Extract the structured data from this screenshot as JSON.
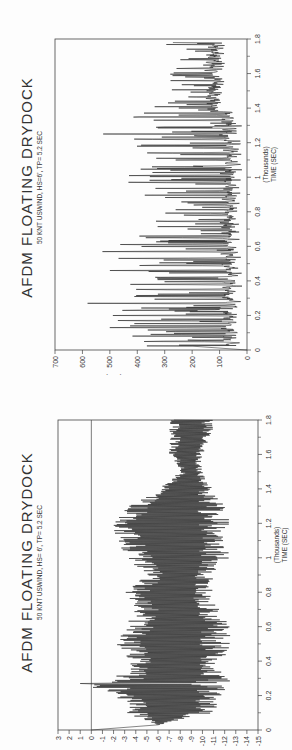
{
  "page": {
    "orientation": "rotated 90deg counter-clockwise (landscape page scanned in portrait)"
  },
  "chart_data": [
    {
      "type": "line",
      "title": "AFDM FLOATING DRYDOCK",
      "subtitle": "50 KNT USWIND, HS=6', TP= 5.2 SEC",
      "xlabel": "TIME (SEC)",
      "xlabel_units": "(Thousands)",
      "ylabel": "MOORING LINE FORCE (LBS)",
      "ylabel_units": "(Thousands)",
      "xlim": [
        0,
        1.8
      ],
      "ylim": [
        0,
        700
      ],
      "x_ticks": [
        "0",
        "0.2",
        "0.4",
        "0.6",
        "0.8",
        "1",
        "1.2",
        "1.4",
        "1.6",
        "1.8"
      ],
      "y_ticks": [
        "0",
        "100",
        "200",
        "300",
        "400",
        "500",
        "600",
        "700"
      ],
      "grid": false,
      "legend": null,
      "description": "Highly oscillatory mooring line force time series; baseline ~40-80 kips with frequent spikes. Largest spikes ~630 kips near t=0.27, ~600 near t=0.57, ~530 near t=1.25.",
      "series": [
        {
          "name": "Mooring line force",
          "peaks_x": [
            0.05,
            0.09,
            0.13,
            0.17,
            0.2,
            0.23,
            0.27,
            0.31,
            0.35,
            0.38,
            0.42,
            0.46,
            0.49,
            0.53,
            0.57,
            0.61,
            0.65,
            0.7,
            0.78,
            0.84,
            0.92,
            0.97,
            1.01,
            1.06,
            1.1,
            1.14,
            1.18,
            1.22,
            1.25,
            1.29,
            1.33,
            1.36,
            1.42,
            1.47,
            1.53,
            1.58,
            1.63,
            1.68,
            1.73,
            1.78
          ],
          "peaks_y": [
            450,
            390,
            570,
            550,
            500,
            560,
            630,
            480,
            460,
            445,
            430,
            500,
            470,
            520,
            600,
            540,
            400,
            250,
            280,
            230,
            250,
            480,
            490,
            380,
            300,
            420,
            440,
            500,
            530,
            420,
            360,
            280,
            230,
            160,
            210,
            260,
            300,
            260,
            240,
            270
          ],
          "baseline_approx": 50
        }
      ]
    },
    {
      "type": "line",
      "title": "AFDM FLOATING DRYDOCK",
      "subtitle": "50 KNT USWIND, HS= 6', TP= 5.2 SEC",
      "xlabel": "TIME (SEC)",
      "xlabel_units": "(Thousands)",
      "ylabel": "SWAY (FT)",
      "xlim": [
        0,
        1.8
      ],
      "ylim": [
        -15,
        3
      ],
      "x_ticks": [
        "0",
        "0.2",
        "0.4",
        "0.6",
        "0.8",
        "1",
        "1.2",
        "1.4",
        "1.6",
        "1.8"
      ],
      "y_ticks": [
        "3",
        "2",
        "1",
        "0",
        "-1",
        "-2",
        "-3",
        "-4",
        "-5",
        "-6",
        "-7",
        "-8",
        "-9",
        "-10",
        "-11",
        "-12",
        "-13",
        "-14",
        "-15"
      ],
      "grid": false,
      "reference_line_y": 0,
      "legend": null,
      "description": "Sway oscillates roughly between -2 and -13 ft; initial drift from 0 to about -6 in first ~0.03k sec; spike up to ~+1 ft near t=0.27; envelope narrows after t=1.4 to about -8..-11.",
      "series": [
        {
          "name": "Sway",
          "envelope_x": [
            0.0,
            0.03,
            0.1,
            0.2,
            0.27,
            0.3,
            0.4,
            0.5,
            0.6,
            0.7,
            0.8,
            0.9,
            1.0,
            1.1,
            1.2,
            1.3,
            1.4,
            1.5,
            1.6,
            1.7,
            1.8
          ],
          "envelope_max": [
            0,
            -6,
            -3,
            -2,
            1,
            -2,
            -3,
            -2,
            -3,
            -4,
            -3,
            -5,
            -3,
            -2,
            -2,
            -3,
            -6,
            -8,
            -7,
            -7,
            -7
          ],
          "envelope_min": [
            0,
            -6,
            -11,
            -12,
            -12.5,
            -12.5,
            -12,
            -12.5,
            -12.5,
            -11.5,
            -11,
            -11,
            -12.5,
            -12,
            -12.5,
            -12,
            -11,
            -10,
            -10,
            -11,
            -11
          ]
        }
      ]
    }
  ],
  "charts": {
    "top": {
      "title": "AFDM FLOATING DRYDOCK",
      "subtitle": "50 KNT USWIND, HS=6', TP= 5.2 SEC",
      "ylabel": "MOORING LINE FORCE (LBS)",
      "ylabel_units": "(Thousands)",
      "xlabel": "TIME (SEC)",
      "xlabel_units": "(Thousands)"
    },
    "bottom": {
      "title": "AFDM FLOATING DRYDOCK",
      "subtitle": "50 KNT USWIND, HS= 6', TP= 5.2 SEC",
      "ylabel": "SWAY (FT)",
      "xlabel": "TIME (SEC)",
      "xlabel_units": "(Thousands)"
    }
  }
}
